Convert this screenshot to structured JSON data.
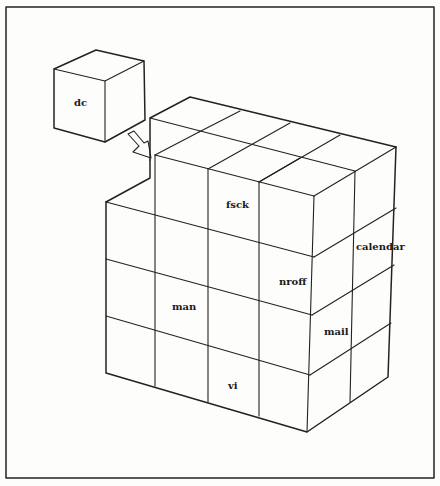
{
  "diagram": {
    "separate_cube": {
      "label": "dc"
    },
    "labels": {
      "fsck": "fsck",
      "calendar": "calendar",
      "nroff": "nroff",
      "man": "man",
      "mail": "mail",
      "vi": "vi"
    },
    "colors": {
      "line": "#222222",
      "background": "#fdfdfb"
    }
  }
}
